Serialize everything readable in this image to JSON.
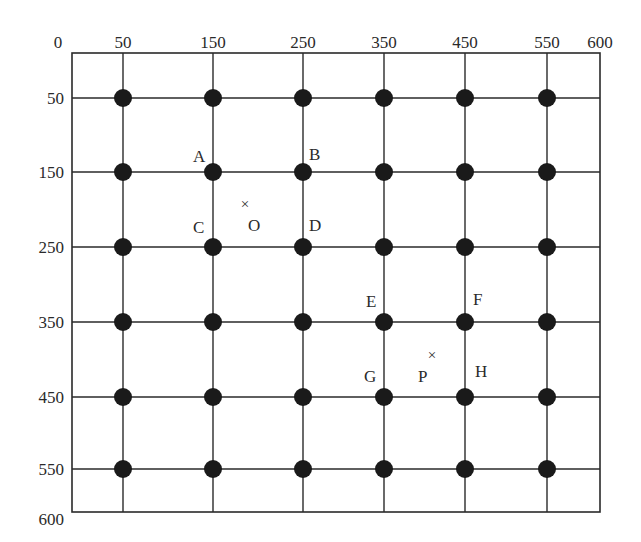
{
  "diagram": {
    "type": "grid-layout",
    "frame": {
      "x_min": 0,
      "x_max": 600,
      "y_min": 0,
      "y_max": 600
    },
    "x_axis": {
      "ticks": [
        {
          "label": "0",
          "value": 0
        },
        {
          "label": "50",
          "value": 50
        },
        {
          "label": "150",
          "value": 150
        },
        {
          "label": "250",
          "value": 250
        },
        {
          "label": "350",
          "value": 350
        },
        {
          "label": "450",
          "value": 450
        },
        {
          "label": "550",
          "value": 550
        },
        {
          "label": "600",
          "value": 600
        }
      ]
    },
    "y_axis": {
      "ticks": [
        {
          "label": "50",
          "value": 50
        },
        {
          "label": "150",
          "value": 150
        },
        {
          "label": "250",
          "value": 250
        },
        {
          "label": "350",
          "value": 350
        },
        {
          "label": "450",
          "value": 450
        },
        {
          "label": "550",
          "value": 550
        },
        {
          "label": "600",
          "value": 600
        }
      ]
    },
    "grid_x": [
      50,
      150,
      250,
      350,
      450,
      550
    ],
    "grid_y": [
      50,
      150,
      250,
      350,
      450,
      550
    ],
    "node_style": {
      "color": "#1a1a1a",
      "line_color": "#2a2a2a"
    },
    "labeled_nodes": [
      {
        "label": "A",
        "x": 150,
        "y": 150
      },
      {
        "label": "B",
        "x": 250,
        "y": 150
      },
      {
        "label": "C",
        "x": 150,
        "y": 250
      },
      {
        "label": "D",
        "x": 250,
        "y": 250
      },
      {
        "label": "E",
        "x": 350,
        "y": 350
      },
      {
        "label": "F",
        "x": 450,
        "y": 350
      },
      {
        "label": "G",
        "x": 350,
        "y": 450
      },
      {
        "label": "H",
        "x": 450,
        "y": 450
      }
    ],
    "points": [
      {
        "label": "O",
        "marker": "×",
        "x": 185,
        "y": 190
      },
      {
        "label": "P",
        "marker": "×",
        "x": 408,
        "y": 400
      }
    ]
  }
}
